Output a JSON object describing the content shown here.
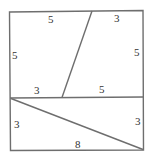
{
  "diagram": {
    "stroke_color": "#6e6e6e",
    "labels": {
      "top_left": "5",
      "top_right": "3",
      "left_upper": "5",
      "right_upper": "5",
      "middle_left": "3",
      "middle_right": "5",
      "left_lower": "3",
      "right_lower": "3",
      "bottom": "8"
    }
  }
}
